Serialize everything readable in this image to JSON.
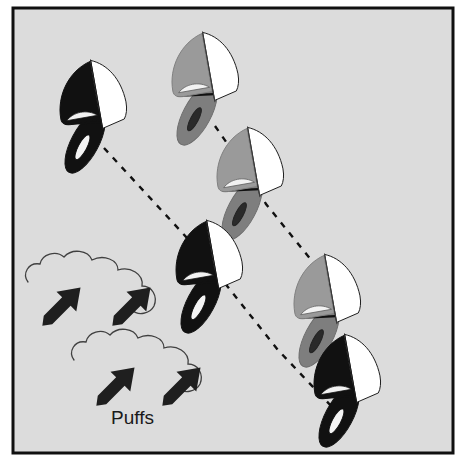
{
  "figure": {
    "width": 461,
    "height": 461,
    "background_color": "#dcdcdc",
    "outside_color": "#ffffff",
    "border_color": "#101010",
    "border_width": 3
  },
  "labels": {
    "puffs": "Puffs"
  },
  "colors": {
    "dark_boat_sail": "#111111",
    "dark_boat_hull": "#111111",
    "dark_boat_cockpit": "#f2f2f2",
    "gray_boat_sail": "#9a9a9a",
    "gray_boat_hull": "#7e7e7e",
    "gray_boat_cockpit": "#2a2a2a",
    "jib_color": "#ffffff",
    "outline_color": "#1a1a1a",
    "dash_color": "#111111",
    "arrow_color": "#1f1f1f",
    "cloud_outline": "#404040"
  },
  "boats": [
    {
      "id": "boat-dark-1",
      "name": "dark-boat-upper-left",
      "shade": "dark",
      "x": 98,
      "y": 103,
      "scale": 1.0,
      "rotation": -12
    },
    {
      "id": "boat-gray-1",
      "name": "gray-boat-upper-right",
      "shade": "gray",
      "x": 210,
      "y": 72,
      "scale": 1.0,
      "rotation": -12
    },
    {
      "id": "boat-gray-2",
      "name": "gray-boat-upper-middle",
      "shade": "gray",
      "x": 253,
      "y": 168,
      "scale": 1.0,
      "rotation": -12
    },
    {
      "id": "boat-dark-2",
      "name": "dark-boat-center",
      "shade": "dark",
      "x": 216,
      "y": 262,
      "scale": 1.0,
      "rotation": -12
    },
    {
      "id": "boat-gray-3",
      "name": "gray-boat-lower-right",
      "shade": "gray",
      "x": 330,
      "y": 296,
      "scale": 1.0,
      "rotation": -12
    },
    {
      "id": "boat-dark-3",
      "name": "dark-boat-lower-right",
      "shade": "dark",
      "x": 352,
      "y": 376,
      "scale": 1.0,
      "rotation": -12
    }
  ],
  "tracks": [
    {
      "id": "track-left",
      "name": "dashed-track-left",
      "points": "104,148 200,252 278,350 333,408",
      "dash": "6 7"
    },
    {
      "id": "track-right",
      "name": "dashed-track-right",
      "points": "215,126 244,170 262,200 313,262 334,288"
    }
  ],
  "puff_clouds": [
    {
      "id": "cloud-upper",
      "name": "puff-cloud-upper",
      "x": 26,
      "y": 252,
      "scale": 1.0
    },
    {
      "id": "cloud-lower",
      "name": "puff-cloud-lower",
      "x": 72,
      "y": 330,
      "scale": 1.0
    }
  ],
  "puff_arrows": [
    {
      "id": "arrow-1",
      "name": "puff-arrow-1",
      "x": 48,
      "y": 282,
      "angle": -45,
      "length": 44
    },
    {
      "id": "arrow-2",
      "name": "puff-arrow-2",
      "x": 118,
      "y": 280,
      "angle": -45,
      "length": 44
    },
    {
      "id": "arrow-3",
      "name": "puff-arrow-3",
      "x": 102,
      "y": 362,
      "angle": -45,
      "length": 44
    },
    {
      "id": "arrow-4",
      "name": "puff-arrow-4",
      "x": 168,
      "y": 362,
      "angle": -45,
      "length": 44
    }
  ],
  "puff_label_position": {
    "x": 111,
    "y": 424
  }
}
